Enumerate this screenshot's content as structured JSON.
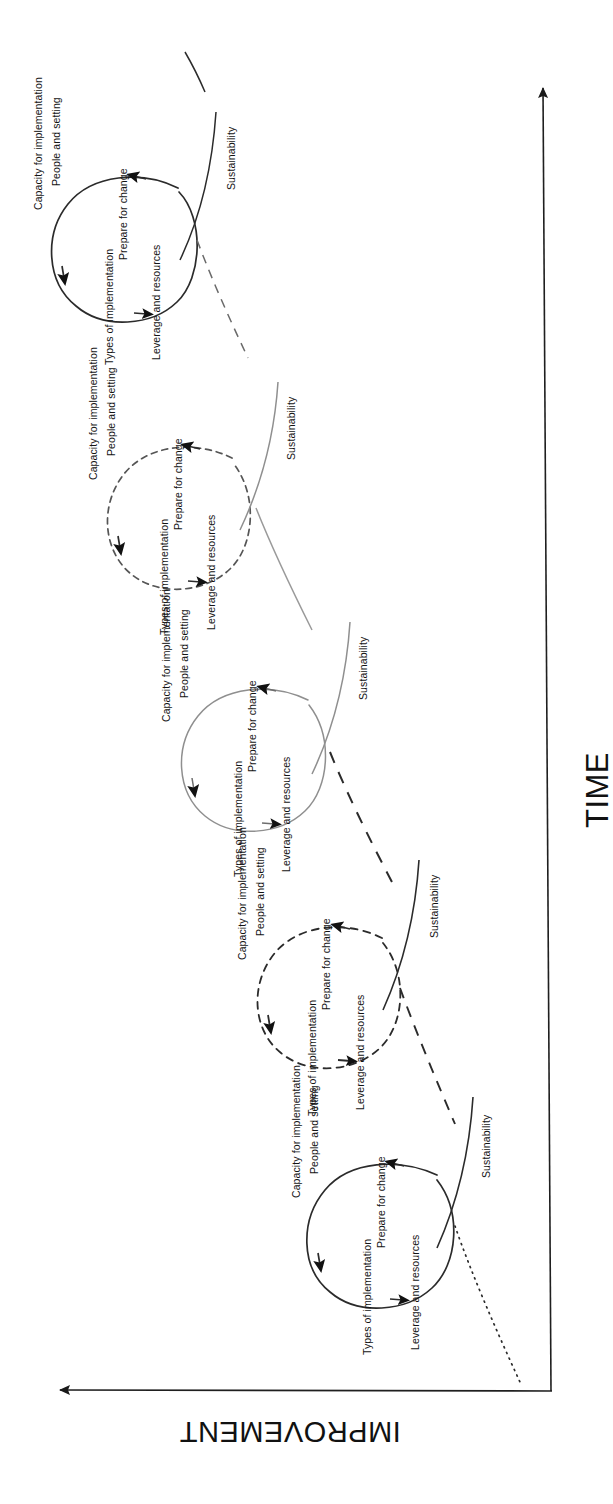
{
  "figure": {
    "orientation": "rotated-90-counterclockwise",
    "axes": {
      "vertical": {
        "label": "IMPROVEMENT",
        "direction": "up",
        "arrow": "arrow-left-in-rotated-frame"
      },
      "horizontal": {
        "label": "TIME",
        "direction": "right",
        "arrow": "arrow-up-in-rotated-frame"
      }
    },
    "cycle_step_labels": [
      "Capacity for implementation",
      "People and setting",
      "Prepare for change",
      "Types of implementation",
      "Leverage and resources"
    ],
    "sustainability_label": "Sustainability",
    "colors": {
      "ink": "#1a1a1a",
      "line_solid": "#2b2b2b",
      "line_light": "#8a8a8a",
      "background": "#ffffff"
    }
  },
  "cycles": [
    {
      "index": 1,
      "order_in_time": 5,
      "line_style": "solid",
      "labels": {
        "capacity": "Capacity for implementation",
        "people": "People and setting",
        "prepare": "Prepare for change",
        "types": "Types of implementation",
        "leverage": "Leverage and resources",
        "sustainability": "Sustainability"
      }
    },
    {
      "index": 2,
      "order_in_time": 4,
      "line_style": "dashed",
      "labels": {
        "capacity": "Capacity for implementation",
        "people": "People and setting",
        "prepare": "Prepare for change",
        "types": "Types of implementation",
        "leverage": "Leverage and resources",
        "sustainability": "Sustainability"
      }
    },
    {
      "index": 3,
      "order_in_time": 3,
      "line_style": "solid-light",
      "labels": {
        "capacity": "Capacity for implementation",
        "people": "People and setting",
        "prepare": "Prepare for change",
        "types": "Types of implementation",
        "leverage": "Leverage and resources",
        "sustainability": "Sustainability"
      }
    },
    {
      "index": 4,
      "order_in_time": 2,
      "line_style": "dashed",
      "labels": {
        "capacity": "Capacity for implementation",
        "people": "People and setting",
        "prepare": "Prepare for change",
        "types": "Types of implementation",
        "leverage": "Leverage and resources",
        "sustainability": "Sustainability"
      }
    },
    {
      "index": 5,
      "order_in_time": 1,
      "line_style": "solid",
      "labels": {
        "capacity": "Capacity for implementation",
        "people": "People and setting",
        "prepare": "Prepare for change",
        "types": "Types of implementation",
        "leverage": "Leverage and resources",
        "sustainability": "Sustainability"
      }
    }
  ]
}
